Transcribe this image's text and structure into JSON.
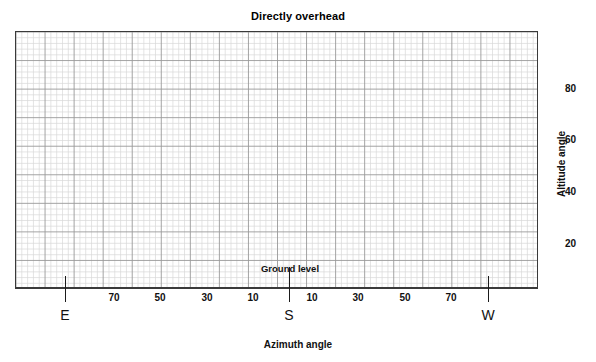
{
  "chart_data": {
    "type": "scatter",
    "title": "Directly overhead",
    "subtitle": "",
    "xlabel": "Azimuth angle",
    "ylabel": "Altitude angle",
    "xlim": [
      -90,
      90
    ],
    "ylim": [
      0,
      90
    ],
    "grid": true,
    "grid_minor_step_x": 2,
    "grid_minor_step_y": 2,
    "grid_major_step_x": 10,
    "grid_major_step_y": 10,
    "legend": "none",
    "series": [],
    "values": [],
    "x": [],
    "xticks": [
      {
        "label": "70",
        "value": -70
      },
      {
        "label": "50",
        "value": -50
      },
      {
        "label": "30",
        "value": -30
      },
      {
        "label": "10",
        "value": -10
      },
      {
        "label": "10",
        "value": 10
      },
      {
        "label": "30",
        "value": 30
      },
      {
        "label": "50",
        "value": 50
      },
      {
        "label": "70",
        "value": 70
      }
    ],
    "yticks": [
      {
        "label": "20",
        "value": 20
      },
      {
        "label": "40",
        "value": 40
      },
      {
        "label": "60",
        "value": 60
      },
      {
        "label": "80",
        "value": 80
      }
    ],
    "cardinal_markers": [
      {
        "label": "E",
        "value": -80
      },
      {
        "label": "S",
        "value": 0
      },
      {
        "label": "W",
        "value": 80
      }
    ],
    "annotations": [
      {
        "text": "Directly overhead",
        "position": "top-center"
      },
      {
        "text": "Ground level",
        "position": "bottom-center"
      },
      {
        "text": "Azimuth angle",
        "position": "below-axis"
      },
      {
        "text": "Altitude angle",
        "position": "right-axis-rotated"
      }
    ],
    "colors": {
      "frame": "#3a3a3a",
      "grid_minor": "#d6d6d6",
      "grid_major": "#9a9a9a",
      "text": "#111111",
      "background": "#ffffff"
    }
  },
  "chart": {
    "title": "Directly overhead",
    "xtitle": "Azimuth angle",
    "ytitle": "Altitude angle",
    "ground_label": "Ground level",
    "xticks": [
      "70",
      "50",
      "30",
      "10",
      "10",
      "30",
      "50",
      "70"
    ],
    "yticks": [
      "80",
      "60",
      "40",
      "20"
    ],
    "cardinals": [
      "E",
      "S",
      "W"
    ]
  }
}
